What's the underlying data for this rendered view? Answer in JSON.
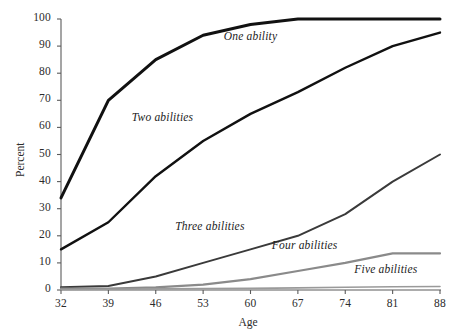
{
  "chart_data": {
    "type": "line",
    "title": "",
    "subtitle": "",
    "xlabel": "Age",
    "ylabel": "Percent",
    "x": [
      32,
      39,
      46,
      53,
      60,
      67,
      74,
      81,
      88
    ],
    "xtick_labels": [
      "32",
      "39",
      "46",
      "53",
      "60",
      "67",
      "74",
      "81",
      "88"
    ],
    "ytick_labels": [
      "0",
      "10",
      "20",
      "30",
      "40",
      "50",
      "60",
      "70",
      "80",
      "90",
      "100"
    ],
    "yticks": [
      0,
      10,
      20,
      30,
      40,
      50,
      60,
      70,
      80,
      90,
      100
    ],
    "xlim": [
      32,
      88
    ],
    "ylim": [
      0,
      100
    ],
    "grid": false,
    "legend_position": "inline-annotations",
    "series": [
      {
        "name": "One ability",
        "color": "#111111",
        "width": 3.0,
        "values": [
          34,
          70,
          85,
          94,
          98,
          100,
          100,
          100,
          100
        ],
        "label_x": 60,
        "label_y": 93
      },
      {
        "name": "Two abilities",
        "color": "#111111",
        "width": 2.4,
        "values": [
          15,
          25,
          42,
          55,
          65,
          73,
          82,
          90,
          95
        ],
        "label_x": 47,
        "label_y": 63
      },
      {
        "name": "Three abilities",
        "color": "#3a3a3a",
        "width": 2.0,
        "values": [
          1,
          1.5,
          5,
          10,
          15,
          20,
          28,
          40,
          50
        ],
        "label_x": 54,
        "label_y": 23
      },
      {
        "name": "Four abilities",
        "color": "#8a8a8a",
        "width": 2.2,
        "values": [
          0.5,
          0.5,
          1,
          2,
          4,
          7,
          10,
          13.5,
          13.5
        ],
        "label_x": 68,
        "label_y": 16
      },
      {
        "name": "Five abilities",
        "color": "#9a9a9a",
        "width": 1.6,
        "values": [
          0.2,
          0.3,
          0.4,
          0.5,
          0.6,
          0.8,
          1.0,
          1.2,
          1.3
        ],
        "label_x": 80,
        "label_y": 7
      }
    ]
  },
  "axes": {
    "x_axis_title": "Age",
    "y_axis_title": "Percent"
  }
}
